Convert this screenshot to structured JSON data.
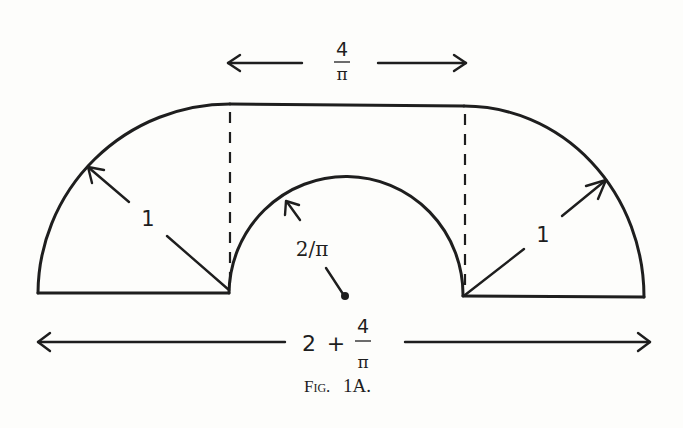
{
  "figure": {
    "caption_prefix": "Fig.",
    "caption_number": "1A."
  },
  "labels": {
    "top_width": {
      "numerator": "4",
      "denominator": "π"
    },
    "left_radius": "1",
    "right_radius": "1",
    "inner_radius": "2/π",
    "total_width": {
      "whole": "2",
      "plus": "+",
      "numerator": "4",
      "denominator": "π"
    }
  },
  "colors": {
    "ink": "#1e1e1e",
    "paper": "#fdfdfb"
  }
}
